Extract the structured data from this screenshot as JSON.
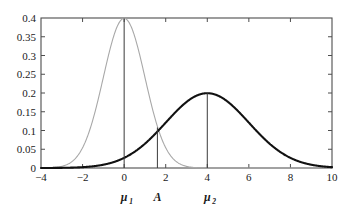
{
  "chart_data": {
    "type": "line",
    "title": "",
    "xlabel": "",
    "ylabel": "",
    "xlim": [
      -4,
      10
    ],
    "ylim": [
      0,
      0.4
    ],
    "grid": false,
    "legend": null,
    "x_ticks": [
      "-4",
      "-2",
      "0",
      "2",
      "4",
      "6",
      "8",
      "10"
    ],
    "x_tick_values": [
      -4,
      -2,
      0,
      2,
      4,
      6,
      8,
      10
    ],
    "y_ticks": [
      "0",
      "0.05",
      "0.1",
      "0.15",
      "0.2",
      "0.25",
      "0.3",
      "0.35",
      "0.4"
    ],
    "y_tick_values": [
      0,
      0.05,
      0.1,
      0.15,
      0.2,
      0.25,
      0.3,
      0.35,
      0.4
    ],
    "series": [
      {
        "name": "distribution-1",
        "kind": "gaussian-pdf",
        "mean": 0,
        "sigma": 1,
        "peak": 0.3989,
        "color": "#a8a8a8",
        "linewidth": 1.1,
        "x": [
          -4,
          -3.5,
          -3,
          -2.5,
          -2,
          -1.5,
          -1,
          -0.5,
          0,
          0.5,
          1,
          1.5,
          2,
          2.5,
          3,
          3.5,
          4
        ],
        "values": [
          0.0001,
          0.0009,
          0.0044,
          0.0175,
          0.054,
          0.1295,
          0.242,
          0.3521,
          0.3989,
          0.3521,
          0.242,
          0.1295,
          0.054,
          0.0175,
          0.0044,
          0.0009,
          0.0001
        ]
      },
      {
        "name": "distribution-2",
        "kind": "gaussian-pdf",
        "mean": 4,
        "sigma": 2,
        "peak": 0.1995,
        "color": "#111111",
        "linewidth": 2.1,
        "x": [
          -4,
          -3,
          -2,
          -1,
          0,
          1,
          2,
          3,
          4,
          5,
          6,
          7,
          8,
          9,
          10
        ],
        "values": [
          0.0001,
          0.0002,
          0.0009,
          0.0033,
          0.0108,
          0.0294,
          0.0648,
          0.121,
          0.1995,
          0.176,
          0.121,
          0.0648,
          0.027,
          0.0088,
          0.0022
        ]
      }
    ],
    "vertical_markers": [
      {
        "name": "mu1",
        "label": "μ",
        "sub": "1",
        "x": 0,
        "y_top": 0.3989,
        "color": "#3a3a3a"
      },
      {
        "name": "threshold-A",
        "label": "A",
        "sub": "",
        "x": 1.6,
        "y_top": 0.108,
        "color": "#3a3a3a"
      },
      {
        "name": "mu2",
        "label": "μ",
        "sub": "2",
        "x": 4,
        "y_top": 0.1995,
        "color": "#3a3a3a"
      }
    ],
    "axis_color": "#4d4d4d",
    "background": "#ffffff"
  }
}
